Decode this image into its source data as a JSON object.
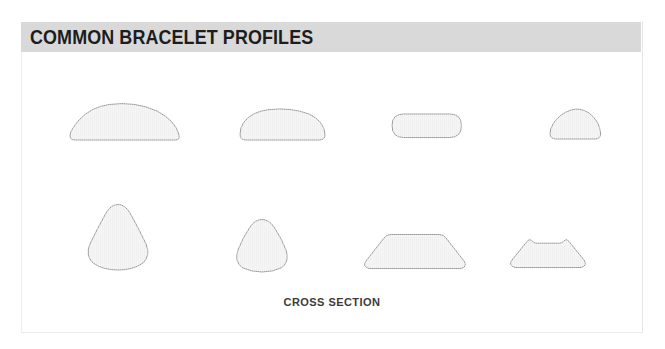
{
  "figure": {
    "title": "COMMON BRACELET PROFILES",
    "caption": "CROSS SECTION",
    "colors": {
      "title_bar": "#d9d9d9",
      "title_text": "#1d1d1d",
      "panel_border": "#e6e6e6",
      "shape_fill": "#f1f1f1",
      "shape_stroke": "#9a9a9a",
      "caption_text": "#3b3b3b",
      "background": "#ffffff"
    },
    "rows": [
      {
        "name": "top-row",
        "shapes": [
          {
            "name": "wide-low-dome",
            "label": "wide low dome"
          },
          {
            "name": "rounded-half-oval",
            "label": "rounded half oval"
          },
          {
            "name": "flat-pill",
            "label": "flat pill"
          },
          {
            "name": "small-dome",
            "label": "small dome"
          }
        ]
      },
      {
        "name": "bottom-row",
        "shapes": [
          {
            "name": "large-rounded-triangle",
            "label": "large rounded triangle"
          },
          {
            "name": "small-rounded-triangle",
            "label": "small rounded triangle"
          },
          {
            "name": "rounded-trapezoid",
            "label": "rounded trapezoid"
          },
          {
            "name": "concave-top-trapezoid",
            "label": "concave top trapezoid"
          }
        ]
      }
    ]
  }
}
